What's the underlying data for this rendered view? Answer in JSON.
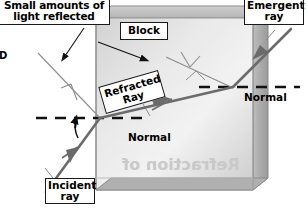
{
  "figure": {
    "background": "#ffffff",
    "width": 307,
    "height": 210
  },
  "colors": {
    "ray": "#6b6b6b",
    "block_fill_light": "#e6e6e6",
    "block_fill_mid": "#cfcfcf",
    "block_side": "#a8a8a8",
    "block_top": "#c2c2c2",
    "block_outline": "#8a8a8a",
    "line_black": "#111111",
    "label_border": "#1a1a1a",
    "label_bg": "#ffffff",
    "thin_ray": "#888888",
    "bleed_text": "#c9c9c9"
  },
  "labels": {
    "reflected": "Small amounts of\nlight reflected",
    "block": "Block",
    "emergent": "Emergent\nray",
    "incident": "Incident\nray",
    "refracted": "Refracted\nRay",
    "normal_left": "Normal",
    "normal_right": "Normal",
    "angle_i": "i",
    "edge_fragment": "D",
    "bleed_through": "Refraction of"
  },
  "geometry": {
    "block": {
      "front_face": "96,18 253,18 253,190 96,190",
      "top_face": "96,18 253,18 268,6 111,6",
      "right_face": "253,18 268,6 268,178 253,190",
      "bevel_corner": "253,18 268,6"
    },
    "normals": {
      "left": {
        "y": 118,
        "x_start": 36,
        "x_end": 150
      },
      "right": {
        "y": 87,
        "x_start": 198,
        "x_end": 300
      }
    },
    "rays": {
      "incident": {
        "from": "48,188",
        "to": "100,118",
        "arrow_at": "75,153"
      },
      "refracted": {
        "from": "100,118",
        "to": "233,87",
        "arrow_at": "166,102"
      },
      "emergent": {
        "from": "233,87",
        "to": "290,32",
        "arrow_at": "262,59"
      },
      "reflected_entry": {
        "from": "100,118",
        "to": "40,55"
      },
      "reflected_exit": {
        "from": "233,87",
        "to": "166,58"
      }
    },
    "pointers": {
      "reflected_label": {
        "from": "82,27",
        "to": "62,62"
      },
      "block_label": {
        "from": "100,42",
        "to": "149,62"
      },
      "emergent_label": {
        "from": "273,28",
        "to": "255,45"
      },
      "incident_label": {
        "from": "56,178",
        "to": "47,170"
      }
    },
    "angle_arc": {
      "center": "100,118",
      "label": "i",
      "radius": 26
    }
  }
}
